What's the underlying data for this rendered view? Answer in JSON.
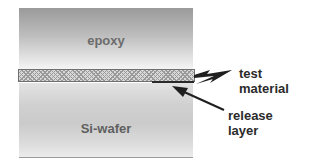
{
  "diagram": {
    "type": "layered cross-section",
    "layers": [
      {
        "name": "epoxy",
        "label": "epoxy",
        "position": "top"
      },
      {
        "name": "test material",
        "label": "",
        "position": "middle",
        "pattern": "crosshatch"
      },
      {
        "name": "release layer",
        "label": "",
        "position": "thin line under test material"
      },
      {
        "name": "Si-wafer",
        "label": "Si-wafer",
        "position": "bottom"
      }
    ],
    "callouts": [
      {
        "line1": "test",
        "line2": "material",
        "points_to": "test material"
      },
      {
        "line1": "release",
        "line2": "layer",
        "points_to": "release layer"
      }
    ]
  },
  "colors": {
    "epoxy_top": "#9a9a9a",
    "epoxy_bottom": "#f4f4f4",
    "hatch": "#9a9a9a",
    "release_line": "#2a2a2a",
    "wafer": "#cbcbcb",
    "label_text": "#2b2b2b"
  }
}
